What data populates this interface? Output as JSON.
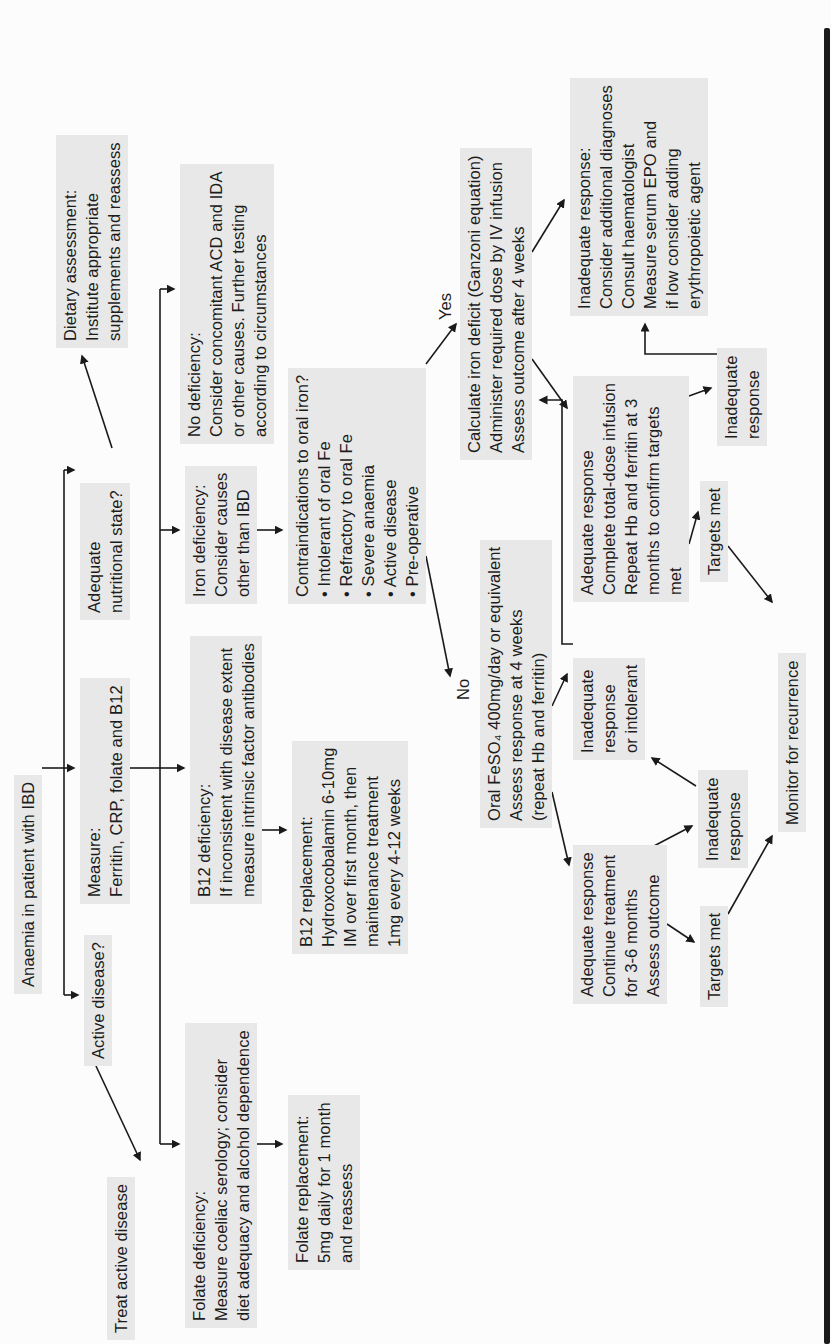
{
  "page": {
    "background": "#fcfcfc",
    "edge_bar_color": "#1b1b1b"
  },
  "flowchart": {
    "box_bg": "#e8e8e8",
    "text_color": "#1c1c1c",
    "line_color": "#1a1a1a",
    "nodes": [
      {
        "id": "anaemia",
        "text": "Anaemia in patient with IBD"
      },
      {
        "id": "active",
        "text": "Active disease?"
      },
      {
        "id": "treat",
        "text": "Treat active disease"
      },
      {
        "id": "measure",
        "text": "Measure:\nFerritin, CRP, folate and B12"
      },
      {
        "id": "adequate-nutritional",
        "text": "Adequate\nnutritional state?"
      },
      {
        "id": "dietary",
        "text": "Dietary assessment:\nInstitute appropriate\nsupplements and reassess"
      },
      {
        "id": "no-def",
        "text": "No deficiency:\nConsider concomitant ACD and IDA\nor other causes. Further testing\naccording to circumstances"
      },
      {
        "id": "iron-def",
        "text": "Iron deficiency:\nConsider causes\nother than IBD"
      },
      {
        "id": "b12-def",
        "text": "B12 deficiency:\nIf inconsistent with disease extent\nmeasure intrinsic factor antibodies"
      },
      {
        "id": "folate-def",
        "text": "Folate deficiency:\nMeasure coeliac serology; consider\ndiet adequacy and alcohol dependence"
      },
      {
        "id": "folate-repl",
        "text": "Folate replacement:\n5mg daily for 1 month\nand reassess"
      },
      {
        "id": "b12-repl",
        "text": "B12 replacement:\nHydroxocobalamin 6-10mg\nIM over first month, then\nmaintenance treatment\n1mg every 4-12 weeks"
      },
      {
        "id": "contra",
        "text": "Contraindications to oral iron?\n• Intolerant of oral Fe\n• Refractory to oral Fe\n• Severe anaemia\n• Active disease\n• Pre-operative"
      },
      {
        "id": "calculate",
        "text": "Calculate iron deficit (Ganzoni equation)\nAdminister required dose by IV infusion\nAssess outcome after 4 weeks"
      },
      {
        "id": "oral",
        "text": "Oral FeSO₄ 400mg/day or equivalent\nAssess response at 4 weeks\n(repeat Hb and ferritin)"
      },
      {
        "id": "adequate-total",
        "text": "Adequate response\nComplete total-dose infusion\nRepeat Hb and ferritin at 3\nmonths to confirm targets\nmet"
      },
      {
        "id": "big-inadequate",
        "text": "Inadequate response:\nConsider additional diagnoses\nConsult haematologist\nMeasure serum EPO and\nif low consider adding\nerythropoietic agent"
      },
      {
        "id": "adequate-continue",
        "text": "Adequate response\nContinue treatment\nfor 3-6 months\nAssess outcome"
      },
      {
        "id": "or-intolerant",
        "text": "Inadequate\nresponse\nor intolerant"
      },
      {
        "id": "inadequate-left",
        "text": "Inadequate\nresponse"
      },
      {
        "id": "targets-left",
        "text": "Targets met"
      },
      {
        "id": "inadequate-right",
        "text": "Inadequate\nresponse"
      },
      {
        "id": "targets-right",
        "text": "Targets met"
      },
      {
        "id": "monitor",
        "text": "Monitor for recurrence"
      }
    ],
    "labels": [
      {
        "id": "yes",
        "text": "Yes"
      },
      {
        "id": "no",
        "text": "No"
      }
    ]
  }
}
